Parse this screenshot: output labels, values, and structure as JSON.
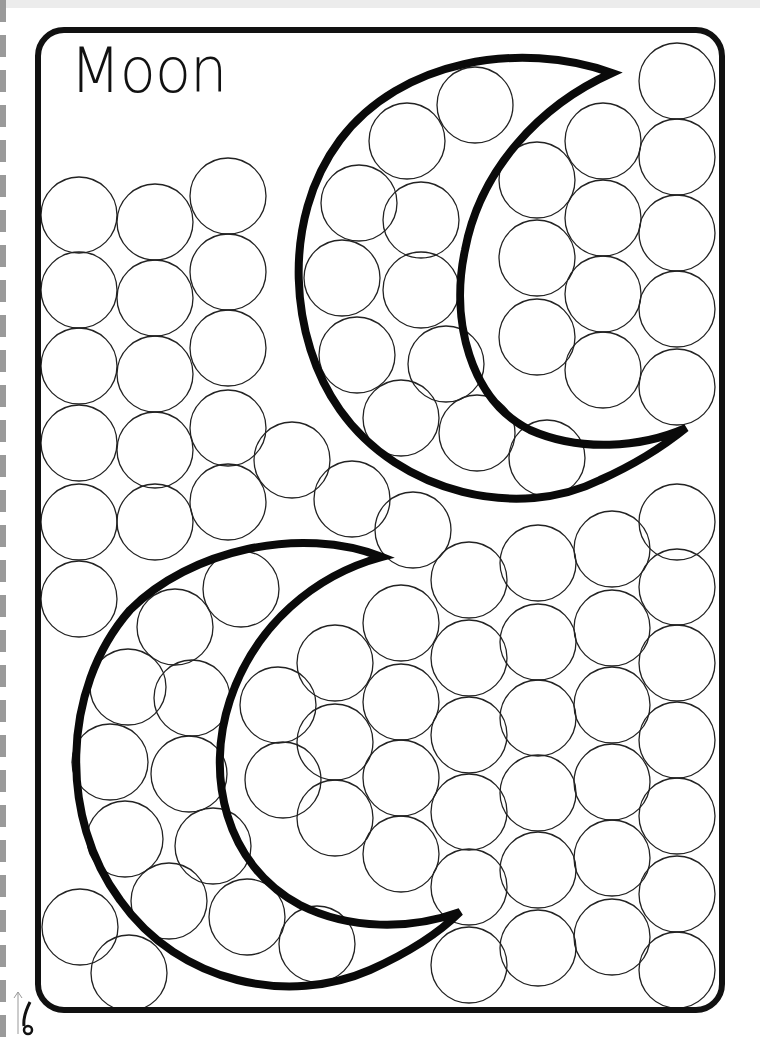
{
  "worksheet": {
    "title": "Moon",
    "frame": {
      "x": 38,
      "y": 30,
      "w": 684,
      "h": 980,
      "radius": 26,
      "stroke": 6,
      "color": "#111111"
    },
    "circle_radius": 38,
    "circles": [
      [
        79,
        215
      ],
      [
        79,
        290
      ],
      [
        79,
        366
      ],
      [
        79,
        443
      ],
      [
        79,
        522
      ],
      [
        79,
        599
      ],
      [
        155,
        222
      ],
      [
        155,
        298
      ],
      [
        155,
        374
      ],
      [
        155,
        450
      ],
      [
        155,
        522
      ],
      [
        228,
        196
      ],
      [
        228,
        272
      ],
      [
        228,
        348
      ],
      [
        228,
        428
      ],
      [
        228,
        502
      ],
      [
        292,
        460
      ],
      [
        352,
        499
      ],
      [
        413,
        530
      ],
      [
        475,
        105
      ],
      [
        407,
        141
      ],
      [
        359,
        203
      ],
      [
        421,
        220
      ],
      [
        342,
        278
      ],
      [
        421,
        290
      ],
      [
        357,
        355
      ],
      [
        446,
        364
      ],
      [
        401,
        418
      ],
      [
        477,
        433
      ],
      [
        547,
        458
      ],
      [
        537,
        180
      ],
      [
        537,
        258
      ],
      [
        537,
        337
      ],
      [
        603,
        141
      ],
      [
        603,
        218
      ],
      [
        603,
        294
      ],
      [
        603,
        370
      ],
      [
        677,
        81
      ],
      [
        677,
        157
      ],
      [
        677,
        233
      ],
      [
        677,
        309
      ],
      [
        677,
        387
      ],
      [
        241,
        589
      ],
      [
        175,
        627
      ],
      [
        128,
        687
      ],
      [
        192,
        698
      ],
      [
        110,
        762
      ],
      [
        189,
        774
      ],
      [
        125,
        839
      ],
      [
        213,
        846
      ],
      [
        169,
        901
      ],
      [
        247,
        917
      ],
      [
        317,
        944
      ],
      [
        80,
        927
      ],
      [
        129,
        973
      ],
      [
        278,
        705
      ],
      [
        283,
        780
      ],
      [
        335,
        663
      ],
      [
        335,
        742
      ],
      [
        335,
        818
      ],
      [
        401,
        623
      ],
      [
        401,
        702
      ],
      [
        401,
        778
      ],
      [
        401,
        854
      ],
      [
        469,
        580
      ],
      [
        469,
        658
      ],
      [
        469,
        735
      ],
      [
        469,
        812
      ],
      [
        469,
        887
      ],
      [
        469,
        965
      ],
      [
        538,
        563
      ],
      [
        538,
        642
      ],
      [
        538,
        718
      ],
      [
        538,
        793
      ],
      [
        538,
        870
      ],
      [
        538,
        948
      ],
      [
        612,
        549
      ],
      [
        612,
        628
      ],
      [
        612,
        705
      ],
      [
        612,
        782
      ],
      [
        612,
        858
      ],
      [
        612,
        937
      ],
      [
        677,
        522
      ],
      [
        677,
        587
      ],
      [
        677,
        663
      ],
      [
        677,
        740
      ],
      [
        677,
        816
      ],
      [
        677,
        894
      ],
      [
        677,
        970
      ]
    ],
    "moons": [
      {
        "name": "upper-moon",
        "path": "M612,73 C520,40 400,60 340,140 C280,220 290,340 340,410 C400,495 520,520 600,480 C640,462 665,445 686,428 C640,448 580,452 530,430 C470,400 450,320 465,250 C480,170 540,105 612,73 Z"
      },
      {
        "name": "lower-moon",
        "path": "M382,557 C300,525 190,550 130,610 C60,690 60,820 120,900 C180,985 290,1005 370,970 C410,952 440,932 460,912 C410,930 350,930 300,905 C225,865 205,775 230,700 C255,625 315,575 382,557 Z"
      }
    ],
    "binding_marks": 30
  }
}
